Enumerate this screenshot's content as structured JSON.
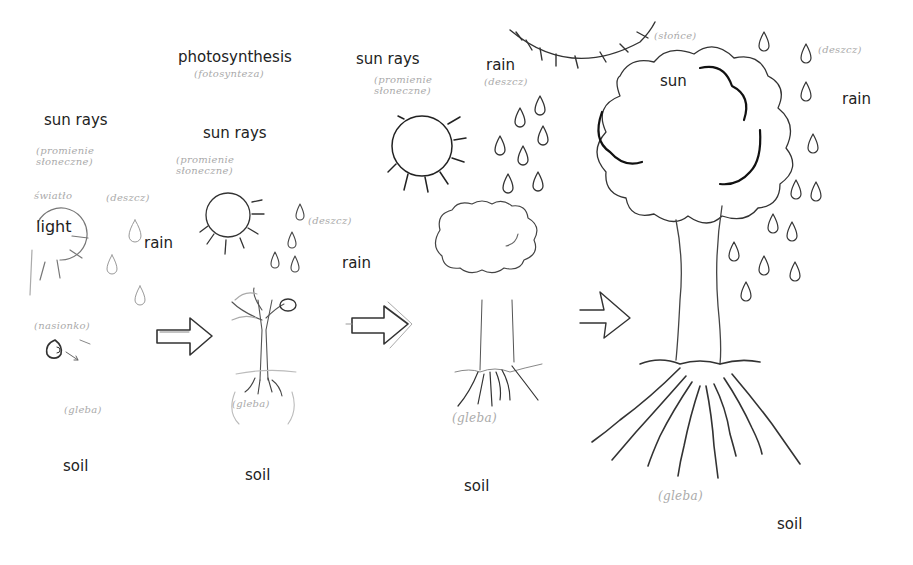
{
  "diagram": {
    "stages": [
      {
        "id": "seed",
        "labels": {
          "sun": "sun rays",
          "light": "light",
          "rain": "rain",
          "soil": "soil"
        },
        "handwritten": {
          "sun": "(promienie słoneczne)",
          "light": "światło",
          "rain": "(deszcz)",
          "seed": "(nasionko)",
          "soil": "(gleba)"
        }
      },
      {
        "id": "sprout",
        "labels": {
          "process": "photosynthesis",
          "sun": "sun rays",
          "rain": "rain",
          "soil": "soil"
        },
        "handwritten": {
          "process": "(fotosynteza)",
          "sun": "(promienie słoneczne)",
          "rain": "(deszcz)",
          "soil": "(gleba)"
        }
      },
      {
        "id": "young-tree",
        "labels": {
          "sun": "sun rays",
          "rain": "rain",
          "soil": "soil"
        },
        "handwritten": {
          "sun": "(promienie słoneczne)",
          "rain": "(deszcz)",
          "soil": "(gleba)"
        }
      },
      {
        "id": "mature-tree",
        "labels": {
          "sun": "sun",
          "rain": "rain",
          "soil": "soil"
        },
        "handwritten": {
          "sun": "(słońce)",
          "rain": "(deszcz)",
          "soil": "(gleba)"
        }
      }
    ],
    "arrows": [
      "arrow-1",
      "arrow-2",
      "arrow-3"
    ],
    "colors": {
      "background": "#ffffff",
      "ink": "#222222",
      "pencil": "#555555",
      "faint": "#aaaaaa"
    }
  }
}
